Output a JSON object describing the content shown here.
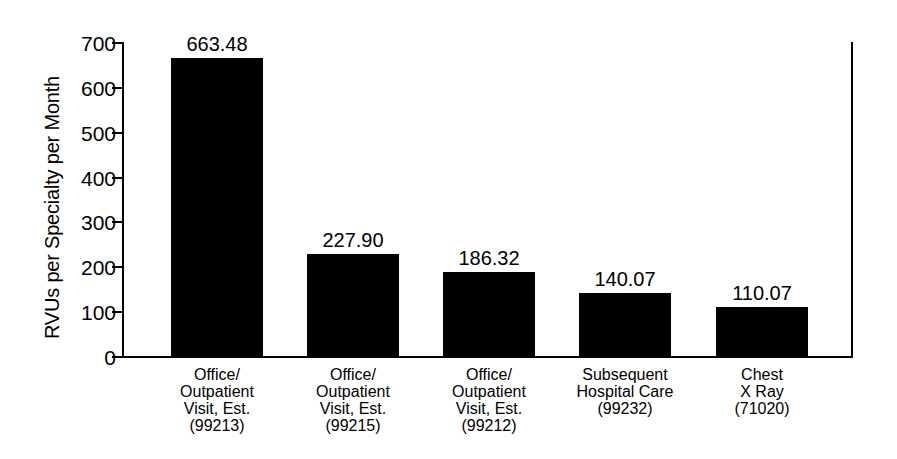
{
  "chart_data": {
    "type": "bar",
    "title": "",
    "xlabel": "",
    "ylabel": "RVUs per Specialty per Month",
    "ylim": [
      0,
      700
    ],
    "yticks": [
      0,
      100,
      200,
      300,
      400,
      500,
      600,
      700
    ],
    "ytick_labels": [
      "0",
      "100",
      "200",
      "300",
      "400",
      "500",
      "600",
      "700"
    ],
    "grid": false,
    "legend": "none",
    "bar_color": "#000000",
    "categories": [
      "Office/\nOutpatient\nVisit, Est.\n(99213)",
      "Office/\nOutpatient\nVisit, Est.\n(99215)",
      "Office/\nOutpatient\nVisit, Est.\n(99212)",
      "Subsequent\nHospital Care\n(99232)",
      "Chest\nX Ray\n(71020)"
    ],
    "values": [
      663.48,
      227.9,
      186.32,
      140.07,
      110.07
    ],
    "value_labels": [
      "663.48",
      "227.90",
      "186.32",
      "140.07",
      "110.07"
    ]
  }
}
